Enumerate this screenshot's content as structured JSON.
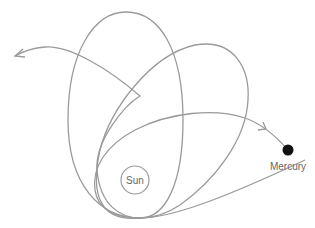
{
  "diagram": {
    "type": "precessing-orbit",
    "bodies": {
      "sun": {
        "label": "Sun",
        "stroke": "#9a9a9a"
      },
      "planet": {
        "label": "Mercury",
        "color": "#111111"
      }
    },
    "orbit_color": "#9a9a9a",
    "text_color": "#666666",
    "orbit_loops": 3,
    "direction_arrows": 2
  }
}
